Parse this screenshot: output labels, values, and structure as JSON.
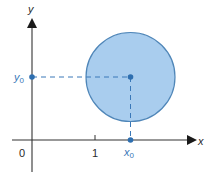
{
  "diagram": {
    "axes": {
      "x_label": "x",
      "y_label": "y",
      "origin_label": "0",
      "tick_label_1": "1"
    },
    "point_labels": {
      "x0_main": "x",
      "x0_sub": "0",
      "y0_main": "y",
      "y0_sub": "0"
    },
    "shape": "circle centered at (x0, y0)",
    "colors": {
      "circle_fill": "#a9cdee",
      "circle_stroke": "#4f86b8",
      "point": "#2e6fb0",
      "dashed_line": "#3a78b8",
      "axis": "#333333"
    }
  }
}
